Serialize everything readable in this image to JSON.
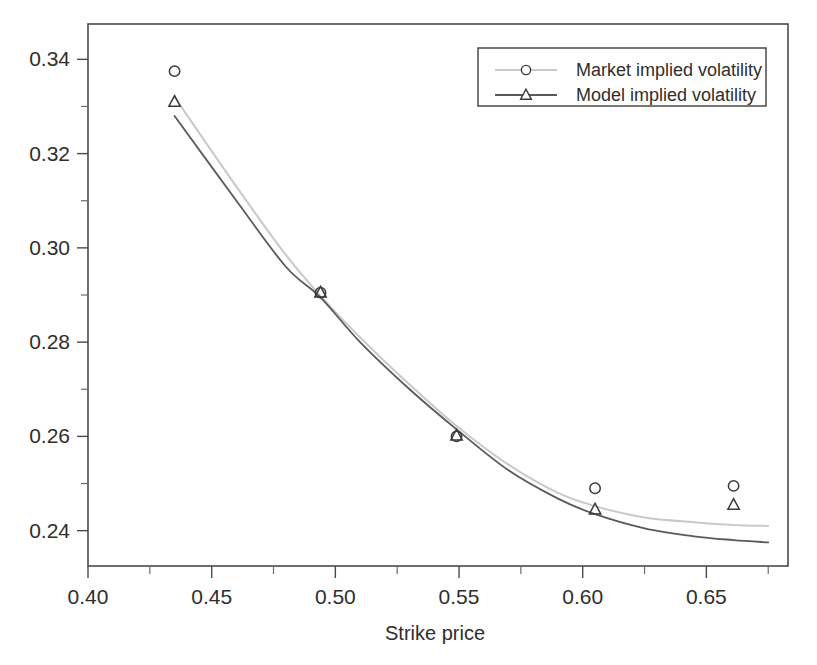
{
  "chart_data": {
    "type": "line",
    "title": "",
    "xlabel": "Strike price",
    "ylabel": "",
    "xlim": [
      0.4,
      0.683
    ],
    "ylim": [
      0.2325,
      0.3475
    ],
    "grid": false,
    "legend_position": "top-right",
    "x_ticks": [
      0.4,
      0.45,
      0.5,
      0.55,
      0.6,
      0.65
    ],
    "x_tick_labels": [
      "0.40",
      "0.45",
      "0.50",
      "0.55",
      "0.60",
      "0.65"
    ],
    "x_minor_ticks": [
      0.425,
      0.475,
      0.525,
      0.575,
      0.625,
      0.675
    ],
    "y_ticks": [
      0.24,
      0.26,
      0.28,
      0.3,
      0.32,
      0.34
    ],
    "y_tick_labels": [
      "0.24",
      "0.26",
      "0.28",
      "0.30",
      "0.32",
      "0.34"
    ],
    "y_minor_ticks": [
      0.25,
      0.27,
      0.29,
      0.31,
      0.33
    ],
    "x": [
      0.435,
      0.494,
      0.549,
      0.605,
      0.661
    ],
    "series": [
      {
        "name": "Market implied volatility",
        "marker": "circle",
        "color": "#c9c9c9",
        "marker_color": "#3a3a3a",
        "values": [
          0.3375,
          0.2905,
          0.26,
          0.249,
          0.2495
        ],
        "curve": [
          [
            0.435,
            0.332
          ],
          [
            0.46,
            0.313
          ],
          [
            0.48,
            0.2985
          ],
          [
            0.494,
            0.2898
          ],
          [
            0.51,
            0.281
          ],
          [
            0.53,
            0.271
          ],
          [
            0.549,
            0.2622
          ],
          [
            0.57,
            0.254
          ],
          [
            0.59,
            0.248
          ],
          [
            0.605,
            0.2452
          ],
          [
            0.625,
            0.2428
          ],
          [
            0.645,
            0.2418
          ],
          [
            0.661,
            0.2412
          ],
          [
            0.675,
            0.241
          ]
        ]
      },
      {
        "name": "Model implied volatility",
        "marker": "triangle",
        "color": "#5a5a5a",
        "marker_color": "#3a3a3a",
        "values": [
          0.331,
          0.2905,
          0.2602,
          0.2445,
          0.2455
        ],
        "curve": [
          [
            0.435,
            0.328
          ],
          [
            0.46,
            0.31
          ],
          [
            0.48,
            0.296
          ],
          [
            0.494,
            0.2895
          ],
          [
            0.51,
            0.28
          ],
          [
            0.53,
            0.27
          ],
          [
            0.549,
            0.2615
          ],
          [
            0.57,
            0.2528
          ],
          [
            0.59,
            0.2468
          ],
          [
            0.605,
            0.2435
          ],
          [
            0.625,
            0.2405
          ],
          [
            0.645,
            0.2388
          ],
          [
            0.661,
            0.238
          ],
          [
            0.675,
            0.2375
          ]
        ]
      }
    ],
    "legend_entries": [
      {
        "label": "Market implied volatility",
        "marker": "circle",
        "line_color": "#c9c9c9"
      },
      {
        "label": "Model implied volatility",
        "marker": "triangle",
        "line_color": "#5a5a5a"
      }
    ]
  }
}
